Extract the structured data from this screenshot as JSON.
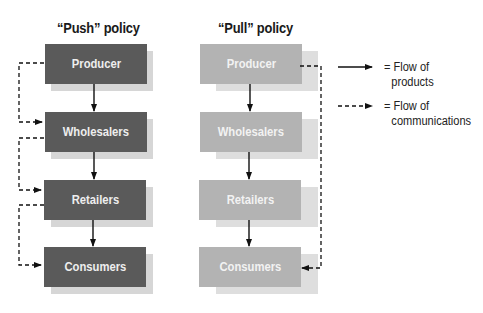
{
  "diagram": {
    "push": {
      "title": "“Push” policy",
      "nodes": [
        {
          "label": "Producer"
        },
        {
          "label": "Wholesalers"
        },
        {
          "label": "Retailers"
        },
        {
          "label": "Consumers"
        }
      ],
      "box_color": "#5a5a5a"
    },
    "pull": {
      "title": "“Pull” policy",
      "nodes": [
        {
          "label": "Producer"
        },
        {
          "label": "Wholesalers"
        },
        {
          "label": "Retailers"
        },
        {
          "label": "Consumers"
        }
      ],
      "box_color": "#b3b3b3"
    },
    "legend": {
      "items": [
        {
          "icon": "solid-arrow-icon",
          "text_line1": "= Flow of",
          "text_line2": "products"
        },
        {
          "icon": "dashed-arrow-icon",
          "text_line1": "= Flow of",
          "text_line2": "communications"
        }
      ]
    },
    "edges": {
      "products": [
        {
          "from": "Producer",
          "to": "Wholesalers",
          "style": "solid"
        },
        {
          "from": "Wholesalers",
          "to": "Retailers",
          "style": "solid"
        },
        {
          "from": "Retailers",
          "to": "Consumers",
          "style": "solid"
        }
      ],
      "push_communications": [
        {
          "from": "Producer",
          "to": "Wholesalers",
          "style": "dashed"
        },
        {
          "from": "Wholesalers",
          "to": "Retailers",
          "style": "dashed"
        },
        {
          "from": "Retailers",
          "to": "Consumers",
          "style": "dashed"
        }
      ],
      "pull_communications": [
        {
          "from": "Producer",
          "to": "Consumers",
          "style": "dashed"
        }
      ]
    }
  }
}
